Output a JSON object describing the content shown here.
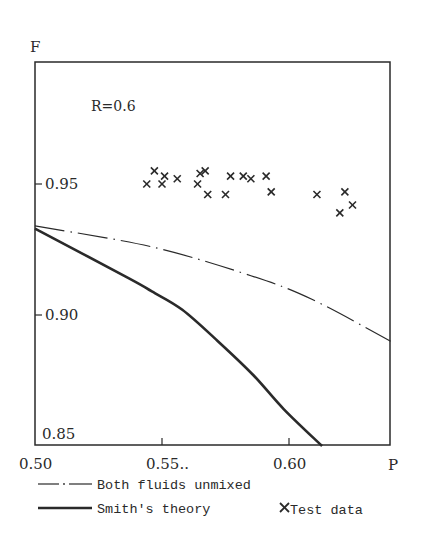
{
  "chart_data": {
    "type": "scatter",
    "title": "",
    "annotation": "R=0.6",
    "xlabel": "P",
    "ylabel": "F",
    "xlim": [
      0.5,
      0.64
    ],
    "ylim": [
      0.85,
      0.996
    ],
    "grid": false,
    "legend_position": "below",
    "x_ticks": [
      {
        "value": 0.5,
        "label": "0.50"
      },
      {
        "value": 0.55,
        "label": "0.55.."
      },
      {
        "value": 0.6,
        "label": "0.60"
      }
    ],
    "y_ticks": [
      {
        "value": 0.95,
        "label": "0.95"
      },
      {
        "value": 0.9,
        "label": "0.90"
      },
      {
        "value": 0.85,
        "label": "0.85"
      }
    ],
    "series": [
      {
        "name": "Both fluids unmixed",
        "kind": "line",
        "style": "dash-dot",
        "x": [
          0.5,
          0.546,
          0.585,
          0.609,
          0.64
        ],
        "y": [
          0.934,
          0.926,
          0.915,
          0.906,
          0.89
        ]
      },
      {
        "name": "Smith's theory",
        "kind": "line",
        "style": "solid-thick",
        "x": [
          0.5,
          0.537,
          0.546,
          0.558,
          0.572,
          0.586,
          0.598,
          0.613
        ],
        "y": [
          0.933,
          0.914,
          0.909,
          0.902,
          0.89,
          0.877,
          0.864,
          0.85
        ]
      },
      {
        "name": "Test data",
        "kind": "scatter",
        "marker": "x",
        "x": [
          0.547,
          0.551,
          0.544,
          0.55,
          0.556,
          0.565,
          0.567,
          0.564,
          0.568,
          0.577,
          0.582,
          0.585,
          0.591,
          0.575,
          0.593,
          0.611,
          0.622,
          0.625,
          0.62
        ],
        "y": [
          0.955,
          0.953,
          0.95,
          0.95,
          0.952,
          0.954,
          0.955,
          0.95,
          0.946,
          0.953,
          0.953,
          0.952,
          0.953,
          0.946,
          0.947,
          0.946,
          0.947,
          0.942,
          0.939
        ]
      }
    ]
  },
  "legend": {
    "items": [
      {
        "label": "Both fluids unmixed",
        "style": "dash-dot"
      },
      {
        "label": "Smith's theory",
        "style": "solid-thick"
      },
      {
        "label": "Test data",
        "style": "x-marker"
      }
    ]
  },
  "colors": {
    "ink": "#2a2a2a",
    "background": "#ffffff"
  }
}
